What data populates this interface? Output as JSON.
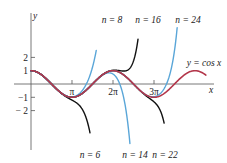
{
  "chart_data": {
    "type": "line",
    "title": "",
    "xlabel": "x",
    "ylabel": "y",
    "x_ticks": [
      {
        "value": 3.14159,
        "label": "π"
      },
      {
        "value": 6.28319,
        "label": "2π"
      },
      {
        "value": 9.42478,
        "label": "3π"
      }
    ],
    "y_ticks": [
      {
        "value": 2,
        "label": "2"
      },
      {
        "value": 1,
        "label": "1"
      },
      {
        "value": -1,
        "label": "−1"
      },
      {
        "value": -2,
        "label": "− 2"
      }
    ],
    "xlim": [
      -1.3,
      14.0
    ],
    "ylim": [
      -5.0,
      5.4
    ],
    "grid": false,
    "legend": "none (curves labeled directly)",
    "series": [
      {
        "name": "y = cos x",
        "function": "cos",
        "x_range": [
          0,
          13.4
        ],
        "color": "#b3364a",
        "label": "y = cos x"
      },
      {
        "name": "n = 6",
        "taylor_degree": 6,
        "x_range": [
          0,
          4.52
        ],
        "color": "#111111",
        "label": "n = 6"
      },
      {
        "name": "n = 8",
        "taylor_degree": 8,
        "x_range": [
          0,
          5.0
        ],
        "color": "#5aa6d8",
        "label": "n = 8"
      },
      {
        "name": "n = 14",
        "taylor_degree": 14,
        "x_range": [
          0,
          7.95
        ],
        "color": "#5aa6d8",
        "label": "n = 14"
      },
      {
        "name": "n = 16",
        "taylor_degree": 16,
        "x_range": [
          0,
          8.2
        ],
        "color": "#111111",
        "label": "n = 16"
      },
      {
        "name": "n = 22",
        "taylor_degree": 22,
        "x_range": [
          0,
          10.2
        ],
        "color": "#111111",
        "label": "n = 22"
      },
      {
        "name": "n = 24",
        "taylor_degree": 24,
        "x_range": [
          0,
          11.35
        ],
        "color": "#5aa6d8",
        "label": "n = 24"
      }
    ],
    "annotations": [
      {
        "text": "n = 8",
        "x_px": 112,
        "y_px": 23
      },
      {
        "text": "n = 16",
        "x_px": 148,
        "y_px": 23
      },
      {
        "text": "n = 24",
        "x_px": 188,
        "y_px": 23
      },
      {
        "text": "y = cos x",
        "x_px": 204,
        "y_px": 66
      },
      {
        "text": "n = 6",
        "x_px": 90,
        "y_px": 158
      },
      {
        "text": "n = 14",
        "x_px": 135,
        "y_px": 158
      },
      {
        "text": "n = 22",
        "x_px": 165,
        "y_px": 158
      }
    ]
  }
}
